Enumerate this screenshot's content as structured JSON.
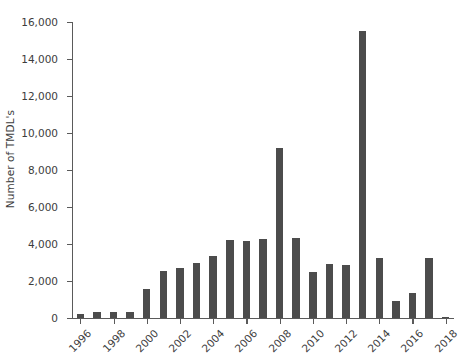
{
  "chart_data": {
    "type": "bar",
    "title": "",
    "xlabel": "",
    "ylabel": "Number of TMDL's",
    "ylim": [
      0,
      16000
    ],
    "ytick_step": 2000,
    "ytick_labels": [
      "0",
      "2,000",
      "4,000",
      "6,000",
      "8,000",
      "10,000",
      "12,000",
      "14,000",
      "16,000"
    ],
    "ytick_values": [
      0,
      2000,
      4000,
      6000,
      8000,
      10000,
      12000,
      14000,
      16000
    ],
    "xtick_labels": [
      "1996",
      "1998",
      "2000",
      "2002",
      "2004",
      "2006",
      "2008",
      "2010",
      "2012",
      "2014",
      "2016",
      "2018"
    ],
    "xtick_values": [
      1996,
      1998,
      2000,
      2002,
      2004,
      2006,
      2008,
      2010,
      2012,
      2014,
      2016,
      2018
    ],
    "xlim": [
      1995.5,
      2018.5
    ],
    "grid": false,
    "legend": false,
    "bar_color": "#4c4c4c",
    "axis_color": "#5a5a5a",
    "categories": [
      1996,
      1997,
      1998,
      1999,
      2000,
      2001,
      2002,
      2003,
      2004,
      2005,
      2006,
      2007,
      2008,
      2009,
      2010,
      2011,
      2012,
      2013,
      2014,
      2015,
      2016,
      2017,
      2018
    ],
    "values": [
      200,
      330,
      340,
      300,
      1550,
      2550,
      2700,
      3000,
      3350,
      4200,
      4150,
      4250,
      9200,
      4350,
      2500,
      2900,
      2850,
      15500,
      3250,
      900,
      1350,
      3250,
      80
    ],
    "series": [
      {
        "name": "Number of TMDL's",
        "values": [
          200,
          330,
          340,
          300,
          1550,
          2550,
          2700,
          3000,
          3350,
          4200,
          4150,
          4250,
          9200,
          4350,
          2500,
          2900,
          2850,
          15500,
          3250,
          900,
          1350,
          3250,
          80
        ]
      }
    ]
  }
}
